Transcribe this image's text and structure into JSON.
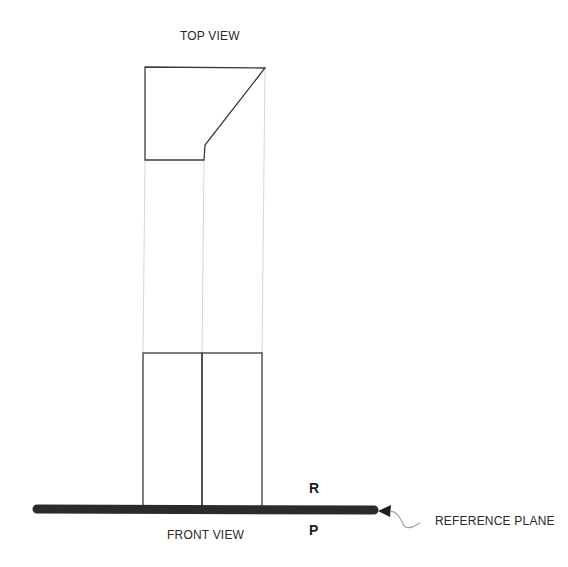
{
  "diagram": {
    "title_top": "TOP VIEW",
    "title_front": "FRONT VIEW",
    "plane_upper_label": "R",
    "plane_lower_label": "P",
    "reference_label": "REFERENCE PLANE"
  },
  "colors": {
    "line": "#3a3a3a",
    "projection": "#d6d6d6",
    "plane": "#2b2b2b",
    "text": "#2a2a2a"
  }
}
